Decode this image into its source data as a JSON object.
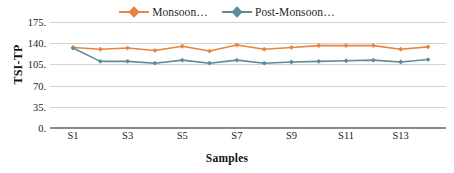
{
  "chart_data": {
    "type": "line",
    "title": "",
    "xlabel": "Samples",
    "ylabel": "TSI-TP",
    "categories": [
      "S1",
      "S2",
      "S3",
      "S4",
      "S5",
      "S6",
      "S7",
      "S8",
      "S9",
      "S10",
      "S11",
      "S12",
      "S13",
      "S14"
    ],
    "x_tick_labels": [
      "S1",
      "S3",
      "S5",
      "S7",
      "S9",
      "S11",
      "S13"
    ],
    "x_tick_indices": [
      0,
      2,
      4,
      6,
      8,
      10,
      12
    ],
    "ylim": [
      0,
      175
    ],
    "y_ticks": [
      0,
      35,
      70,
      105,
      140,
      175
    ],
    "y_tick_labels": [
      "0.",
      "35.",
      "70.",
      "105.",
      "140.",
      "175."
    ],
    "grid": true,
    "legend_position": "top-center",
    "series": [
      {
        "name": "Monsoon...",
        "color": "#e8843c",
        "marker": "diamond",
        "values": [
          133,
          130,
          132,
          128,
          135,
          127,
          137,
          130,
          133,
          136,
          136,
          136,
          130,
          134
        ]
      },
      {
        "name": "Post-Monsoon...",
        "color": "#5c8b99",
        "marker": "diamond",
        "values": [
          132,
          110,
          110,
          107,
          112,
          107,
          112,
          107,
          109,
          110,
          111,
          112,
          109,
          113
        ]
      }
    ]
  },
  "legend": {
    "entries": [
      {
        "label": "Monsoon…"
      },
      {
        "label": "Post-Monsoon…"
      }
    ]
  },
  "axes": {
    "y_title": "TSI-TP",
    "x_title": "Samples"
  },
  "colors": {
    "monsoon": "#e8843c",
    "post_monsoon": "#5c8b99",
    "gridline": "#d2d2d2",
    "axis": "#8a8a8a",
    "text": "#1a1a1a",
    "background": "#ffffff"
  }
}
